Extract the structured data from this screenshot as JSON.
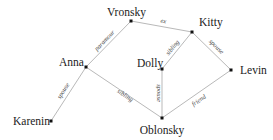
{
  "diagram": {
    "type": "social-relationship-graph",
    "nodes": [
      {
        "id": "vronsky",
        "label": "Vronsky",
        "x": 131,
        "y": 21
      },
      {
        "id": "kitty",
        "label": "Kitty",
        "x": 192,
        "y": 32
      },
      {
        "id": "anna",
        "label": "Anna",
        "x": 86,
        "y": 67
      },
      {
        "id": "dolly",
        "label": "Dolly",
        "x": 162,
        "y": 69
      },
      {
        "id": "levin",
        "label": "Levin",
        "x": 231,
        "y": 70
      },
      {
        "id": "oblonsky",
        "label": "Oblonsky",
        "x": 162,
        "y": 118
      },
      {
        "id": "karenin",
        "label": "Karenin",
        "x": 51,
        "y": 121
      }
    ],
    "edges": [
      {
        "from": "anna",
        "to": "vronsky",
        "label": "paramour"
      },
      {
        "from": "vronsky",
        "to": "kitty",
        "label": "ex"
      },
      {
        "from": "kitty",
        "to": "dolly",
        "label": "sibling"
      },
      {
        "from": "kitty",
        "to": "levin",
        "label": "spouse"
      },
      {
        "from": "anna",
        "to": "karenin",
        "label": "spouse"
      },
      {
        "from": "anna",
        "to": "oblonsky",
        "label": "sibling"
      },
      {
        "from": "dolly",
        "to": "oblonsky",
        "label": "spouse"
      },
      {
        "from": "levin",
        "to": "oblonsky",
        "label": "friend"
      }
    ]
  }
}
